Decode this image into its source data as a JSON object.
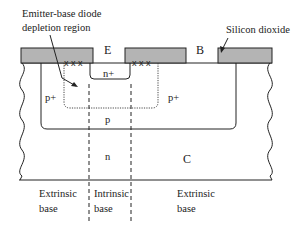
{
  "diagram": {
    "terminals": {
      "emitter": "E",
      "base": "B",
      "collector": "C"
    },
    "regions": {
      "emitter_doping": "n+",
      "extrinsic_base_left": "p+",
      "extrinsic_base_right": "p+",
      "intrinsic_base": "p",
      "collector": "n"
    },
    "annotations": {
      "depletion_line1": "Emitter-base diode",
      "depletion_line2": "depletion region",
      "oxide": "Silicon dioxide",
      "defect_marker": "x x x"
    },
    "bottom_labels": {
      "left_line1": "Extrinsic",
      "left_line2": "base",
      "middle_line1": "Intrinsic",
      "middle_line2": "base",
      "right_line1": "Extrinsic",
      "right_line2": "base"
    },
    "colors": {
      "oxide_fill": "#b4b4b4",
      "ink": "#222222"
    }
  }
}
